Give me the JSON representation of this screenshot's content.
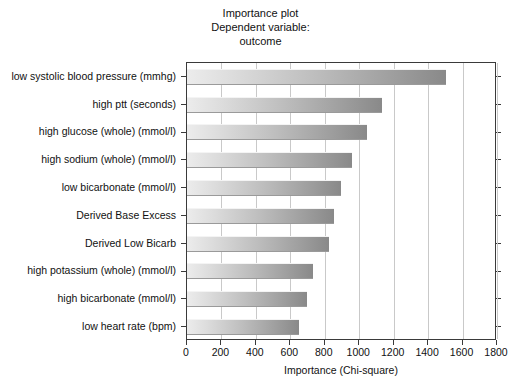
{
  "chart_data": {
    "type": "bar",
    "orientation": "horizontal",
    "title": "Importance plot",
    "subtitle": "Dependent variable:",
    "subtitle2": "outcome",
    "title_lines": [
      "Importance plot",
      "Dependent variable:",
      "outcome"
    ],
    "xlabel": "Importance (Chi-square)",
    "ylabel": "",
    "xlim": [
      0,
      1800
    ],
    "ylim": null,
    "grid": "vertical",
    "legend": null,
    "categories": [
      "low systolic blood pressure (mmhg)",
      "high ptt (seconds)",
      "high glucose (whole) (mmol/l)",
      "high sodium (whole) (mmol/l)",
      "low bicarbonate (mmol/l)",
      "Derived Base Excess",
      "Derived Low Bicarb",
      "high potassium (whole) (mmol/l)",
      "high bicarbonate (mmol/l)",
      "low heart rate (bpm)"
    ],
    "values": [
      1504,
      1134,
      1048,
      959,
      895,
      853,
      822,
      733,
      694,
      651
    ],
    "xticks": [
      0,
      200,
      400,
      600,
      800,
      1000,
      1200,
      1400,
      1600,
      1800
    ],
    "xtick_labels": [
      "0",
      "200",
      "400",
      "600",
      "800",
      "1000",
      "1200",
      "1400",
      "1600",
      "1800"
    ],
    "colors": {
      "bar_gradient_start": "#ececec",
      "bar_gradient_end": "#898989",
      "gridline": "#c9c9c9",
      "axis": "#3a3a3a",
      "background": "#ffffff",
      "text": "#111111"
    }
  }
}
